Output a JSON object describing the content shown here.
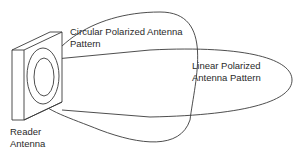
{
  "diagram": {
    "labels": {
      "circular_line1": "Circular Polarized Antenna",
      "circular_line2": "Pattern",
      "linear_line1": "Linear Polarized",
      "linear_line2": "Antenna Pattern",
      "reader_line1": "Reader",
      "reader_line2": "Antenna"
    },
    "colors": {
      "stroke": "#3a3a3a",
      "text": "#2a2a2a",
      "background": "#ffffff"
    }
  }
}
